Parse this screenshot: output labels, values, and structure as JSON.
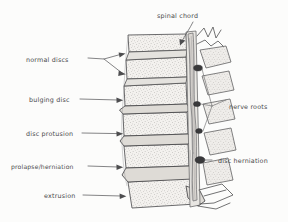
{
  "figure": {
    "background_color": "#fcfcfb",
    "ink_color": "#4a4a4c",
    "style": "hand-drawn pencil sketch"
  },
  "labels": {
    "normal_discs": "normal discs",
    "bulging_disc": "bulging disc",
    "disc_protusion": "disc protusion",
    "prolapse_herniation": "prolapse/herniation",
    "extrusion": "extrusion",
    "spinal_chord": "spinal chord",
    "nerve_roots": "nerve roots",
    "disc_herniation": "disc herniation"
  },
  "annotations": [
    {
      "id": "normal-discs",
      "text": "normal discs",
      "side": "left",
      "leader": "forked",
      "arrow_count": 2,
      "text_x": 26,
      "text_y": 60,
      "targets": [
        [
          126,
          57
        ],
        [
          126,
          73
        ]
      ]
    },
    {
      "id": "bulging-disc",
      "text": "bulging disc",
      "side": "left",
      "leader": "straight",
      "arrow_count": 1,
      "text_x": 29,
      "text_y": 101,
      "targets": [
        [
          124,
          101
        ]
      ]
    },
    {
      "id": "disc-protusion",
      "text": "disc protusion",
      "side": "left",
      "leader": "straight",
      "arrow_count": 1,
      "text_x": 26,
      "text_y": 134,
      "targets": [
        [
          124,
          134
        ]
      ]
    },
    {
      "id": "prolapse-herniation",
      "text": "prolapse/herniation",
      "side": "left",
      "leader": "straight",
      "arrow_count": 1,
      "text_x": 12,
      "text_y": 168,
      "targets": [
        [
          124,
          168
        ]
      ]
    },
    {
      "id": "extrusion",
      "text": "extrusion",
      "side": "left",
      "leader": "straight",
      "arrow_count": 1,
      "text_x": 43,
      "text_y": 196,
      "targets": [
        [
          127,
          196
        ]
      ]
    },
    {
      "id": "spinal-chord",
      "text": "spinal chord",
      "side": "top",
      "leader": "curved",
      "arrow_count": 1,
      "text_x": 157,
      "text_y": 17,
      "targets": [
        [
          178,
          45
        ]
      ]
    },
    {
      "id": "nerve-roots",
      "text": "nerve roots",
      "side": "right",
      "leader": "forked",
      "arrow_count": 3,
      "text_x": 215,
      "text_y": 111,
      "targets": [
        [
          172,
          71
        ],
        [
          176,
          106
        ],
        [
          178,
          131
        ]
      ]
    },
    {
      "id": "disc-herniation",
      "text": "disc herniation",
      "side": "right",
      "leader": "straight",
      "arrow_count": 1,
      "text_x": 215,
      "text_y": 163,
      "targets": [
        [
          180,
          158
        ]
      ]
    }
  ],
  "anatomy": {
    "vertebra_count": 6,
    "disc_count": 5,
    "disc_conditions": [
      "normal",
      "normal",
      "bulging",
      "protrusion",
      "prolapse",
      "extrusion"
    ],
    "compression_points": 4,
    "structures": [
      "vertebral body",
      "intervertebral disc",
      "spinal canal",
      "spinal cord",
      "nerve root",
      "spinous process",
      "facet joint"
    ]
  }
}
